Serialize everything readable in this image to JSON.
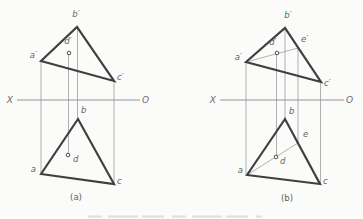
{
  "figure": {
    "background": "#fbfbfa",
    "colors": {
      "thick_stroke": "#3f3f3f",
      "thin_stroke": "#8f8f8f",
      "axis_stroke": "#7c7c7c",
      "label": "#636363",
      "caption": "#5c5c5c",
      "remnant": "#d9d9d9"
    },
    "stroke_widths": {
      "thick": 2.2,
      "thin": 0.7,
      "axis": 0.8
    },
    "point_marker_radius": 1.8,
    "diagrams": [
      {
        "id": "a",
        "caption": {
          "text": "(a)",
          "x": 76,
          "y": 200
        },
        "axis": {
          "x1": 17,
          "x2": 140,
          "y": 100
        },
        "thick_polygons": [
          {
            "name": "front-view-triangle-abc-prime",
            "points": [
              [
                41,
                61
              ],
              [
                77,
                27
              ],
              [
                114,
                81
              ]
            ]
          },
          {
            "name": "top-view-triangle-abc",
            "points": [
              [
                41,
                174
              ],
              [
                78,
                119
              ],
              [
                114,
                184
              ]
            ]
          }
        ],
        "thin_lines": [
          {
            "name": "projector-a",
            "x1": 41,
            "y1": 61,
            "x2": 41,
            "y2": 174
          },
          {
            "name": "projector-d",
            "x1": 68.5,
            "y1": 53,
            "x2": 68.5,
            "y2": 155
          },
          {
            "name": "projector-b",
            "x1": 77.5,
            "y1": 27,
            "x2": 77.5,
            "y2": 119
          },
          {
            "name": "projector-c",
            "x1": 114,
            "y1": 81,
            "x2": 114,
            "y2": 184
          }
        ],
        "point_markers": [
          {
            "name": "point-d-prime",
            "x": 69,
            "y": 53
          },
          {
            "name": "point-d",
            "x": 68,
            "y": 155
          }
        ],
        "labels": [
          {
            "name": "label-x-axis",
            "text": "X",
            "x": 13,
            "y": 103,
            "anchor": "end",
            "cls": "axis-label"
          },
          {
            "name": "label-o-axis",
            "text": "O",
            "x": 142,
            "y": 103,
            "anchor": "start",
            "cls": "axis-label"
          },
          {
            "name": "label-a-prime",
            "text": "a′",
            "x": 37,
            "y": 58,
            "anchor": "end",
            "cls": "pt-label"
          },
          {
            "name": "label-b-prime",
            "text": "b′",
            "x": 76,
            "y": 17,
            "anchor": "middle",
            "cls": "pt-label"
          },
          {
            "name": "label-c-prime",
            "text": "c′",
            "x": 117,
            "y": 80,
            "anchor": "start",
            "cls": "pt-label"
          },
          {
            "name": "label-d-prime",
            "text": "d′",
            "x": 68,
            "y": 44,
            "anchor": "middle",
            "cls": "pt-label"
          },
          {
            "name": "label-a",
            "text": "a",
            "x": 36,
            "y": 172,
            "anchor": "end",
            "cls": "pt-label"
          },
          {
            "name": "label-b",
            "text": "b",
            "x": 81,
            "y": 113,
            "anchor": "start",
            "cls": "pt-label"
          },
          {
            "name": "label-c",
            "text": "c",
            "x": 117,
            "y": 184,
            "anchor": "start",
            "cls": "pt-label"
          },
          {
            "name": "label-d",
            "text": "d",
            "x": 73,
            "y": 162,
            "anchor": "start",
            "cls": "pt-label"
          }
        ]
      },
      {
        "id": "b",
        "caption": {
          "text": "(b)",
          "x": 287,
          "y": 201
        },
        "axis": {
          "x1": 220,
          "x2": 344,
          "y": 100
        },
        "thick_polygons": [
          {
            "name": "front-view-triangle-abc-prime",
            "points": [
              [
                246,
                62
              ],
              [
                285,
                28
              ],
              [
                321,
                82
              ]
            ]
          },
          {
            "name": "top-view-triangle-abc",
            "points": [
              [
                247,
                175
              ],
              [
                285,
                119
              ],
              [
                320,
                184
              ]
            ]
          }
        ],
        "thin_lines": [
          {
            "name": "cut-line-a-prime-e-prime",
            "x1": 246,
            "y1": 62,
            "x2": 298,
            "y2": 48
          },
          {
            "name": "cut-line-a-e",
            "x1": 247,
            "y1": 175,
            "x2": 298,
            "y2": 143
          },
          {
            "name": "projector-a",
            "x1": 246,
            "y1": 62,
            "x2": 246,
            "y2": 175
          },
          {
            "name": "projector-d",
            "x1": 276.5,
            "y1": 53,
            "x2": 276.5,
            "y2": 157
          },
          {
            "name": "projector-b",
            "x1": 285,
            "y1": 28,
            "x2": 285,
            "y2": 119
          },
          {
            "name": "projector-e",
            "x1": 298,
            "y1": 48,
            "x2": 298,
            "y2": 143
          },
          {
            "name": "projector-c",
            "x1": 320.5,
            "y1": 82,
            "x2": 320.5,
            "y2": 184
          }
        ],
        "point_markers": [
          {
            "name": "point-d-prime",
            "x": 277,
            "y": 53
          },
          {
            "name": "point-d",
            "x": 276,
            "y": 157
          }
        ],
        "labels": [
          {
            "name": "label-x-axis",
            "text": "X",
            "x": 216,
            "y": 103,
            "anchor": "end",
            "cls": "axis-label"
          },
          {
            "name": "label-o-axis",
            "text": "O",
            "x": 346,
            "y": 103,
            "anchor": "start",
            "cls": "axis-label"
          },
          {
            "name": "label-a-prime",
            "text": "a′",
            "x": 242,
            "y": 60,
            "anchor": "end",
            "cls": "pt-label"
          },
          {
            "name": "label-b-prime",
            "text": "b′",
            "x": 288,
            "y": 18,
            "anchor": "middle",
            "cls": "pt-label"
          },
          {
            "name": "label-c-prime",
            "text": "c′",
            "x": 324,
            "y": 86,
            "anchor": "start",
            "cls": "pt-label"
          },
          {
            "name": "label-d-prime",
            "text": "d′",
            "x": 273,
            "y": 45,
            "anchor": "middle",
            "cls": "pt-label"
          },
          {
            "name": "label-e-prime",
            "text": "e′",
            "x": 301,
            "y": 42,
            "anchor": "start",
            "cls": "pt-label"
          },
          {
            "name": "label-a",
            "text": "a",
            "x": 243,
            "y": 173,
            "anchor": "end",
            "cls": "pt-label"
          },
          {
            "name": "label-b",
            "text": "b",
            "x": 289,
            "y": 114,
            "anchor": "start",
            "cls": "pt-label"
          },
          {
            "name": "label-c",
            "text": "c",
            "x": 323,
            "y": 184,
            "anchor": "start",
            "cls": "pt-label"
          },
          {
            "name": "label-d",
            "text": "d",
            "x": 280,
            "y": 164,
            "anchor": "start",
            "cls": "pt-label"
          },
          {
            "name": "label-e",
            "text": "e",
            "x": 303,
            "y": 137,
            "anchor": "start",
            "cls": "pt-label"
          }
        ]
      }
    ],
    "bottom_remnant": {
      "x1": 88,
      "x2": 262,
      "y": 216.5
    }
  }
}
